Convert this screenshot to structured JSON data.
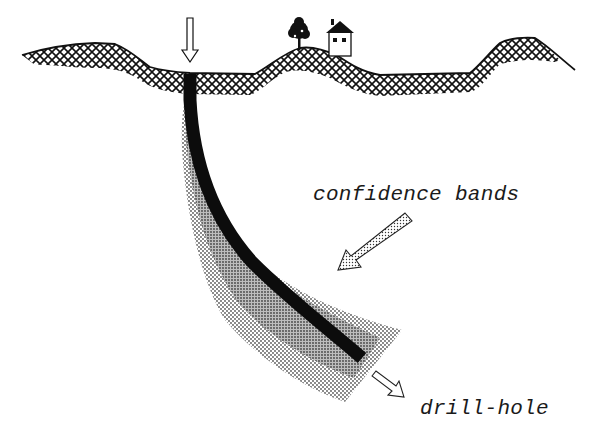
{
  "diagram": {
    "labels": {
      "confidence_bands": "confidence bands",
      "drill_hole": "drill-hole"
    },
    "elements": {
      "ground_surface": "cross-hatched terrain profile",
      "surface_marker": "downward outline arrow marking drill-hole collar",
      "landmarks": [
        "tree",
        "house"
      ],
      "drill_hole": "curved solid black trajectory",
      "confidence_bands": [
        "inner band (dense stipple)",
        "outer band (sparse stipple)"
      ],
      "pointer_confidence": "stippled arrow pointing to bands",
      "pointer_drill_hole": "outline arrow pointing from hole end"
    },
    "colors": {
      "ink": "#111111",
      "inner_band": "#9a9a9a",
      "outer_band": "#c8c8c8",
      "background": "#ffffff"
    }
  }
}
